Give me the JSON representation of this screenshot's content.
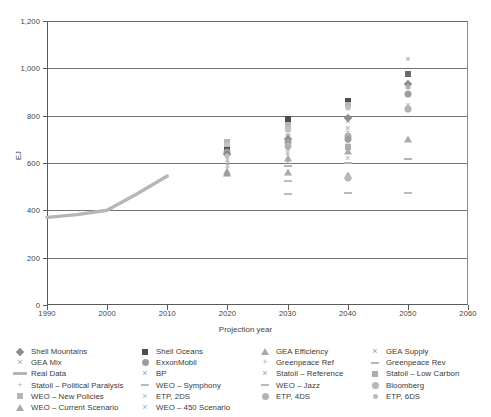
{
  "chart_data": {
    "type": "scatter",
    "title": "",
    "xlabel": "Projection year",
    "ylabel": "EJ",
    "xlim": [
      1990,
      2060
    ],
    "ylim": [
      0,
      1200
    ],
    "xticks": [
      "1990",
      "2000",
      "2010",
      "2020",
      "2030",
      "2040",
      "2050",
      "2060"
    ],
    "yticks": [
      "0",
      "200",
      "400",
      "600",
      "800",
      "1,000",
      "1,200"
    ],
    "grid": "horizontal",
    "legend_position": "bottom",
    "series": [
      {
        "name": "Real Data",
        "marker": "line",
        "color": "#b6b6b6",
        "x": [
          1990,
          1995,
          2000,
          2005,
          2010
        ],
        "values": [
          370,
          382,
          400,
          470,
          545
        ]
      },
      {
        "name": "Shell Mountains",
        "marker": "diamond",
        "color": "#8c8c8c",
        "x": [
          2020,
          2030,
          2040,
          2050
        ],
        "values": [
          640,
          700,
          790,
          930
        ]
      },
      {
        "name": "Shell Oceans",
        "marker": "square-filled",
        "color": "#4d4d4d",
        "x": [
          2020,
          2030,
          2040,
          2050
        ],
        "values": [
          655,
          780,
          860,
          975
        ]
      },
      {
        "name": "GEA Efficiency",
        "marker": "triangle",
        "color": "#a8a8a8",
        "x": [
          2030,
          2040,
          2050
        ],
        "values": [
          560,
          545,
          700
        ]
      },
      {
        "name": "GEA Supply",
        "marker": "cross",
        "color": "#9a9a9a",
        "x": [
          2030,
          2040,
          2050
        ],
        "values": [
          640,
          790,
          1040
        ]
      },
      {
        "name": "GEA Mix",
        "marker": "cross",
        "color": "#a0a0a0",
        "x": [
          2020,
          2030,
          2040
        ],
        "values": [
          600,
          625,
          690
        ]
      },
      {
        "name": "ExxonMobil",
        "marker": "circle-filled",
        "color": "#9e9e9e",
        "x": [
          2020,
          2030,
          2040,
          2050
        ],
        "values": [
          640,
          690,
          700,
          890
        ]
      },
      {
        "name": "Greenpeace Ref",
        "marker": "plus",
        "color": "#b0b0b0",
        "x": [
          2030,
          2040
        ],
        "values": [
          645,
          715
        ]
      },
      {
        "name": "Greenpeace Rev",
        "marker": "dash",
        "color": "#b4b4b4",
        "x": [
          2030,
          2040,
          2050
        ],
        "values": [
          585,
          600,
          615
        ]
      },
      {
        "name": "BP",
        "marker": "cross",
        "color": "#a3a3a3",
        "x": [
          2020,
          2030
        ],
        "values": [
          610,
          660
        ]
      },
      {
        "name": "Statoil – Reference",
        "marker": "cross",
        "color": "#a6a6a6",
        "x": [
          2030,
          2040,
          2050
        ],
        "values": [
          640,
          745,
          845
        ]
      },
      {
        "name": "Statoil – Low Carbon",
        "marker": "square",
        "color": "#adadad",
        "x": [
          2030,
          2040,
          2050
        ],
        "values": [
          610,
          660,
          700
        ]
      },
      {
        "name": "Statoil – Political Paralysis",
        "marker": "plus",
        "color": "#b2b2b2",
        "x": [
          2030,
          2040,
          2050
        ],
        "values": [
          630,
          730,
          820
        ]
      },
      {
        "name": "WEO – Symphony",
        "marker": "dash",
        "color": "#bcbcbc",
        "x": [
          2020,
          2030,
          2040
        ],
        "values": [
          565,
          520,
          540
        ]
      },
      {
        "name": "WEO – Jazz",
        "marker": "dash",
        "color": "#bababa",
        "x": [
          2030,
          2040,
          2050
        ],
        "values": [
          500,
          470,
          475
        ]
      },
      {
        "name": "Bloomberg",
        "marker": "circle",
        "color": "#b8b8b8",
        "x": [
          2040
        ],
        "values": [
          540
        ]
      },
      {
        "name": "WEO – New Policies",
        "marker": "square",
        "color": "#b5b5b5",
        "x": [
          2020,
          2030,
          2040
        ],
        "values": [
          690,
          760,
          835
        ]
      },
      {
        "name": "ETP, 2DS",
        "marker": "cross",
        "color": "#b0b0b0",
        "x": [
          2020,
          2030,
          2040
        ],
        "values": [
          595,
          580,
          600
        ]
      },
      {
        "name": "ETP, 4DS",
        "marker": "circle",
        "color": "#b3b3b3",
        "x": [
          2030,
          2040,
          2050
        ],
        "values": [
          660,
          720,
          830
        ]
      },
      {
        "name": "ETP, 6DS",
        "marker": "dot",
        "color": "#bdbdbd",
        "x": [
          2030,
          2040,
          2050
        ],
        "values": [
          680,
          780,
          880
        ]
      },
      {
        "name": "WEO – Current Scenario",
        "marker": "triangle",
        "color": "#aaaaaa",
        "x": [
          2020,
          2030,
          2040
        ],
        "values": [
          560,
          620,
          660
        ]
      },
      {
        "name": "WEO – 450 Scenario",
        "marker": "cross",
        "color": "#aeaeae",
        "x": [
          2020,
          2030,
          2040
        ],
        "values": [
          580,
          600,
          620
        ]
      }
    ],
    "points": [
      {
        "x": 2020,
        "y": 690,
        "marker": "square",
        "color": "#b5b5b5"
      },
      {
        "x": 2020,
        "y": 678,
        "marker": "square",
        "color": "#bdbdbd"
      },
      {
        "x": 2020,
        "y": 666,
        "marker": "square",
        "color": "#c2c2c2"
      },
      {
        "x": 2020,
        "y": 655,
        "marker": "square-filled",
        "color": "#4d4d4d"
      },
      {
        "x": 2020,
        "y": 648,
        "marker": "circle-filled",
        "color": "#9e9e9e"
      },
      {
        "x": 2020,
        "y": 640,
        "marker": "diamond",
        "color": "#8c8c8c"
      },
      {
        "x": 2020,
        "y": 628,
        "marker": "dot",
        "color": "#c0c0c0"
      },
      {
        "x": 2020,
        "y": 612,
        "marker": "cross",
        "color": "#a3a3a3"
      },
      {
        "x": 2020,
        "y": 600,
        "marker": "cross",
        "color": "#a0a0a0"
      },
      {
        "x": 2020,
        "y": 592,
        "marker": "cross",
        "color": "#aeaeae"
      },
      {
        "x": 2020,
        "y": 580,
        "marker": "plus",
        "color": "#b2b2b2"
      },
      {
        "x": 2020,
        "y": 566,
        "marker": "triangle",
        "color": "#aaaaaa"
      },
      {
        "x": 2020,
        "y": 556,
        "marker": "triangle",
        "color": "#9c9c9c"
      },
      {
        "x": 2030,
        "y": 785,
        "marker": "square-filled",
        "color": "#4d4d4d"
      },
      {
        "x": 2030,
        "y": 762,
        "marker": "square",
        "color": "#b5b5b5"
      },
      {
        "x": 2030,
        "y": 742,
        "marker": "square",
        "color": "#c0c0c0"
      },
      {
        "x": 2030,
        "y": 718,
        "marker": "dot",
        "color": "#c2c2c2"
      },
      {
        "x": 2030,
        "y": 700,
        "marker": "diamond",
        "color": "#8c8c8c"
      },
      {
        "x": 2030,
        "y": 688,
        "marker": "circle-filled",
        "color": "#9e9e9e"
      },
      {
        "x": 2030,
        "y": 672,
        "marker": "circle",
        "color": "#b3b3b3"
      },
      {
        "x": 2030,
        "y": 658,
        "marker": "cross",
        "color": "#a3a3a3"
      },
      {
        "x": 2030,
        "y": 645,
        "marker": "cross",
        "color": "#a6a6a6"
      },
      {
        "x": 2030,
        "y": 634,
        "marker": "plus",
        "color": "#b0b0b0"
      },
      {
        "x": 2030,
        "y": 622,
        "marker": "triangle",
        "color": "#aaaaaa"
      },
      {
        "x": 2030,
        "y": 606,
        "marker": "cross",
        "color": "#aeaeae"
      },
      {
        "x": 2030,
        "y": 588,
        "marker": "dash",
        "color": "#b4b4b4"
      },
      {
        "x": 2030,
        "y": 562,
        "marker": "triangle",
        "color": "#a8a8a8"
      },
      {
        "x": 2030,
        "y": 522,
        "marker": "dash",
        "color": "#bcbcbc"
      },
      {
        "x": 2030,
        "y": 470,
        "marker": "dash",
        "color": "#bababa"
      },
      {
        "x": 2040,
        "y": 862,
        "marker": "square-filled",
        "color": "#4d4d4d"
      },
      {
        "x": 2040,
        "y": 845,
        "marker": "square",
        "color": "#b5b5b5"
      },
      {
        "x": 2040,
        "y": 832,
        "marker": "dot",
        "color": "#c0c0c0"
      },
      {
        "x": 2040,
        "y": 792,
        "marker": "diamond",
        "color": "#8c8c8c"
      },
      {
        "x": 2040,
        "y": 778,
        "marker": "cross",
        "color": "#9a9a9a"
      },
      {
        "x": 2040,
        "y": 748,
        "marker": "cross",
        "color": "#a6a6a6"
      },
      {
        "x": 2040,
        "y": 730,
        "marker": "plus",
        "color": "#b2b2b2"
      },
      {
        "x": 2040,
        "y": 716,
        "marker": "circle",
        "color": "#b3b3b3"
      },
      {
        "x": 2040,
        "y": 700,
        "marker": "circle-filled",
        "color": "#9e9e9e"
      },
      {
        "x": 2040,
        "y": 688,
        "marker": "cross",
        "color": "#a0a0a0"
      },
      {
        "x": 2040,
        "y": 668,
        "marker": "square",
        "color": "#adadad"
      },
      {
        "x": 2040,
        "y": 652,
        "marker": "triangle",
        "color": "#aaaaaa"
      },
      {
        "x": 2040,
        "y": 620,
        "marker": "cross",
        "color": "#aeaeae"
      },
      {
        "x": 2040,
        "y": 600,
        "marker": "dash",
        "color": "#b4b4b4"
      },
      {
        "x": 2040,
        "y": 548,
        "marker": "triangle",
        "color": "#a8a8a8"
      },
      {
        "x": 2040,
        "y": 538,
        "marker": "circle",
        "color": "#b8b8b8"
      },
      {
        "x": 2040,
        "y": 472,
        "marker": "dash",
        "color": "#bababa"
      },
      {
        "x": 2050,
        "y": 1040,
        "marker": "cross",
        "color": "#9a9a9a"
      },
      {
        "x": 2050,
        "y": 975,
        "marker": "square-filled",
        "color": "#6a6a6a"
      },
      {
        "x": 2050,
        "y": 932,
        "marker": "diamond",
        "color": "#8c8c8c"
      },
      {
        "x": 2050,
        "y": 922,
        "marker": "dot",
        "color": "#b0b0b0"
      },
      {
        "x": 2050,
        "y": 890,
        "marker": "circle-filled",
        "color": "#9e9e9e"
      },
      {
        "x": 2050,
        "y": 845,
        "marker": "cross",
        "color": "#a6a6a6"
      },
      {
        "x": 2050,
        "y": 828,
        "marker": "circle",
        "color": "#b3b3b3"
      },
      {
        "x": 2050,
        "y": 818,
        "marker": "plus",
        "color": "#b2b2b2"
      },
      {
        "x": 2050,
        "y": 700,
        "marker": "triangle",
        "color": "#a8a8a8"
      },
      {
        "x": 2050,
        "y": 618,
        "marker": "dash",
        "color": "#b4b4b4"
      },
      {
        "x": 2050,
        "y": 474,
        "marker": "dash",
        "color": "#bababa"
      }
    ]
  },
  "legend": {
    "columns": [
      {
        "items": [
          {
            "label": "Shell Mountains",
            "marker": "diamond",
            "color": "#8c8c8c"
          },
          {
            "label": "GEA Mix",
            "marker": "cross",
            "color": "#a0a0a0"
          },
          {
            "label": "Real Data",
            "marker": "line",
            "color": "#b6b6b6"
          },
          {
            "label": "Statoil – Political Paralysis",
            "marker": "plus",
            "color": "#b2b2b2"
          },
          {
            "label": "WEO – New Policies",
            "marker": "square",
            "color": "#b5b5b5"
          },
          {
            "label": "WEO – Current Scenario",
            "marker": "triangle",
            "color": "#aaaaaa"
          }
        ]
      },
      {
        "items": [
          {
            "label": "Shell Oceans",
            "marker": "square-filled",
            "color": "#4d4d4d"
          },
          {
            "label": "ExxonMobil",
            "marker": "circle-filled",
            "color": "#9e9e9e"
          },
          {
            "label": "BP",
            "marker": "cross",
            "color": "#a3a3a3"
          },
          {
            "label": "WEO – Symphony",
            "marker": "dash",
            "color": "#bcbcbc"
          },
          {
            "label": "ETP, 2DS",
            "marker": "cross",
            "color": "#b0b0b0"
          },
          {
            "label": "WEO – 450 Scenario",
            "marker": "cross",
            "color": "#aeaeae"
          }
        ]
      },
      {
        "items": [
          {
            "label": "GEA Efficiency",
            "marker": "triangle",
            "color": "#a8a8a8"
          },
          {
            "label": "Greenpeace Ref",
            "marker": "plus",
            "color": "#b0b0b0"
          },
          {
            "label": "Statoil – Reference",
            "marker": "cross",
            "color": "#a6a6a6"
          },
          {
            "label": "WEO – Jazz",
            "marker": "dash",
            "color": "#bababa"
          },
          {
            "label": "ETP, 4DS",
            "marker": "circle",
            "color": "#b3b3b3"
          }
        ]
      },
      {
        "items": [
          {
            "label": "GEA Supply",
            "marker": "cross",
            "color": "#9a9a9a"
          },
          {
            "label": "Greenpeace Rev",
            "marker": "dash",
            "color": "#b4b4b4"
          },
          {
            "label": "Statoil – Low Carbon",
            "marker": "square",
            "color": "#adadad"
          },
          {
            "label": "Bloomberg",
            "marker": "circle",
            "color": "#b8b8b8"
          },
          {
            "label": "ETP, 6DS",
            "marker": "dot",
            "color": "#bdbdbd"
          }
        ]
      }
    ]
  }
}
